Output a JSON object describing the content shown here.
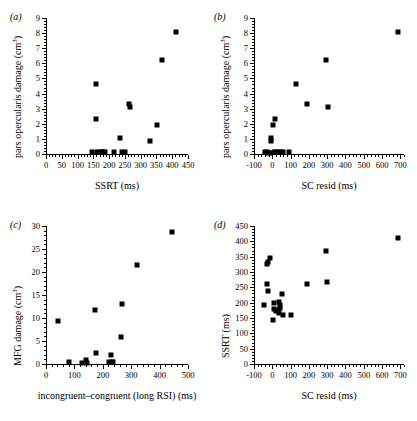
{
  "figure": {
    "background": "#ffffff",
    "marker_color": "#000000",
    "panel_labels": [
      "(a)",
      "(b)",
      "(c)",
      "(d)"
    ]
  },
  "chart_data": [
    {
      "id": "a",
      "panel_label": "(a)",
      "type": "scatter",
      "title": "",
      "xlabel": "SSRT (ms)",
      "ylabel": "pars opercularis damage (cm³)",
      "ylabel_base": "pars opercularis damage (cm",
      "ylabel_sup": "3",
      "ylabel_close": ")",
      "xlim": [
        0,
        450
      ],
      "ylim": [
        0,
        9
      ],
      "xticks": [
        0,
        50,
        100,
        150,
        200,
        250,
        300,
        350,
        400,
        450
      ],
      "yticks": [
        0,
        1,
        2,
        3,
        4,
        5,
        6,
        7,
        8,
        9
      ],
      "xminor_step": 10,
      "yminor_step": 0.2,
      "grid": false,
      "legend": "none",
      "points": [
        {
          "x": 412,
          "y": 8.1
        },
        {
          "x": 368,
          "y": 6.2
        },
        {
          "x": 160,
          "y": 4.6
        },
        {
          "x": 264,
          "y": 3.3
        },
        {
          "x": 266,
          "y": 3.1
        },
        {
          "x": 158,
          "y": 2.3
        },
        {
          "x": 351,
          "y": 1.9
        },
        {
          "x": 236,
          "y": 1.05
        },
        {
          "x": 330,
          "y": 0.85
        },
        {
          "x": 147,
          "y": 0.1
        },
        {
          "x": 163,
          "y": 0.15
        },
        {
          "x": 170,
          "y": 0.1
        },
        {
          "x": 176,
          "y": 0.1
        },
        {
          "x": 182,
          "y": 0.1
        },
        {
          "x": 188,
          "y": 0.1
        },
        {
          "x": 214,
          "y": 0.1
        },
        {
          "x": 242,
          "y": 0.1
        },
        {
          "x": 250,
          "y": 0.1
        }
      ]
    },
    {
      "id": "b",
      "panel_label": "(b)",
      "type": "scatter",
      "title": "",
      "xlabel": "SC resid (ms)",
      "ylabel": "pars opercularis damage (cm³)",
      "ylabel_base": "pars opercularis damage (cm",
      "ylabel_sup": "3",
      "ylabel_close": ")",
      "xlim": [
        -100,
        720
      ],
      "ylim": [
        0,
        9
      ],
      "xticks": [
        -100,
        0,
        100,
        200,
        300,
        400,
        500,
        600,
        700
      ],
      "yticks": [
        0,
        1,
        2,
        3,
        4,
        5,
        6,
        7,
        8,
        9
      ],
      "xminor_step": 20,
      "yminor_step": 0.2,
      "grid": false,
      "legend": "none",
      "points": [
        {
          "x": 685,
          "y": 8.1
        },
        {
          "x": 295,
          "y": 6.2
        },
        {
          "x": 128,
          "y": 4.65
        },
        {
          "x": 192,
          "y": 3.3
        },
        {
          "x": 302,
          "y": 3.1
        },
        {
          "x": 17,
          "y": 2.3
        },
        {
          "x": 5,
          "y": 1.95
        },
        {
          "x": -7,
          "y": 1.05
        },
        {
          "x": -8,
          "y": 0.85
        },
        {
          "x": -40,
          "y": 0.1
        },
        {
          "x": -30,
          "y": 0.1
        },
        {
          "x": -22,
          "y": 0.08
        },
        {
          "x": -14,
          "y": 0.08
        },
        {
          "x": 8,
          "y": 0.1
        },
        {
          "x": 20,
          "y": 0.1
        },
        {
          "x": 32,
          "y": 0.1
        },
        {
          "x": 48,
          "y": 0.15
        },
        {
          "x": 58,
          "y": 0.15
        },
        {
          "x": 90,
          "y": 0.1
        }
      ]
    },
    {
      "id": "c",
      "panel_label": "(c)",
      "type": "scatter",
      "title": "",
      "xlabel": "incongruent–congruent (long RSI) (ms)",
      "ylabel": "MFG damage (cm³)",
      "ylabel_base": "MFG damage (cm",
      "ylabel_sup": "3",
      "ylabel_close": ")",
      "xlim": [
        0,
        500
      ],
      "ylim": [
        0,
        30
      ],
      "xticks": [
        0,
        100,
        200,
        300,
        400,
        500
      ],
      "yticks": [
        0,
        5,
        10,
        15,
        20,
        25,
        30
      ],
      "xminor_step": 20,
      "yminor_step": 1,
      "grid": false,
      "legend": "none",
      "points": [
        {
          "x": 444,
          "y": 28.8
        },
        {
          "x": 322,
          "y": 21.5
        },
        {
          "x": 267,
          "y": 13.0
        },
        {
          "x": 172,
          "y": 11.8
        },
        {
          "x": 42,
          "y": 9.4
        },
        {
          "x": 263,
          "y": 5.9
        },
        {
          "x": 175,
          "y": 2.3
        },
        {
          "x": 228,
          "y": 2.0
        },
        {
          "x": 82,
          "y": 0.35
        },
        {
          "x": 128,
          "y": 0.3
        },
        {
          "x": 140,
          "y": 0.9
        },
        {
          "x": 145,
          "y": 0.3
        },
        {
          "x": 223,
          "y": 0.4
        },
        {
          "x": 231,
          "y": 0.5
        },
        {
          "x": 236,
          "y": 0.4
        }
      ]
    },
    {
      "id": "d",
      "panel_label": "(d)",
      "type": "scatter",
      "title": "",
      "xlabel": "SC resid (ms)",
      "ylabel": "SSRT (ms)",
      "ylabel_base": "SSRT (ms)",
      "ylabel_sup": "",
      "ylabel_close": "",
      "xlim": [
        -100,
        720
      ],
      "ylim": [
        0,
        450
      ],
      "xticks": [
        -100,
        0,
        100,
        200,
        300,
        400,
        500,
        600,
        700
      ],
      "yticks": [
        0,
        50,
        100,
        150,
        200,
        250,
        300,
        350,
        400,
        450
      ],
      "xminor_step": 20,
      "yminor_step": 10,
      "grid": false,
      "legend": "none",
      "points": [
        {
          "x": 685,
          "y": 411
        },
        {
          "x": 296,
          "y": 370
        },
        {
          "x": -12,
          "y": 345
        },
        {
          "x": -26,
          "y": 331
        },
        {
          "x": -28,
          "y": 326
        },
        {
          "x": -30,
          "y": 260
        },
        {
          "x": -26,
          "y": 237
        },
        {
          "x": 190,
          "y": 260
        },
        {
          "x": 298,
          "y": 267
        },
        {
          "x": 52,
          "y": 229
        },
        {
          "x": -45,
          "y": 194
        },
        {
          "x": 12,
          "y": 200
        },
        {
          "x": 38,
          "y": 201
        },
        {
          "x": 40,
          "y": 192
        },
        {
          "x": 44,
          "y": 183
        },
        {
          "x": 8,
          "y": 178
        },
        {
          "x": 20,
          "y": 172
        },
        {
          "x": 30,
          "y": 175
        },
        {
          "x": 34,
          "y": 166
        },
        {
          "x": 58,
          "y": 160
        },
        {
          "x": 100,
          "y": 160
        },
        {
          "x": 2,
          "y": 145
        }
      ]
    }
  ]
}
